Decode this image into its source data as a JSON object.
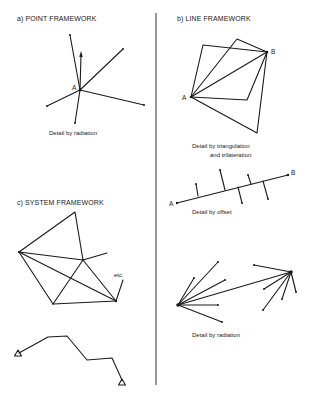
{
  "panels": {
    "a": {
      "title": "a) POINT FRAMEWORK",
      "point_label": "A",
      "caption": "Detail by radiation"
    },
    "b": {
      "title": "b) LINE FRAMEWORK",
      "label_a": "A",
      "label_b": "B",
      "caption_triangulation_1": "Detail by triangulation",
      "caption_triangulation_2": "and trilateration",
      "offset_label_a": "A",
      "offset_label_b": "B",
      "caption_offset": "Detail by offset",
      "caption_radiation": "Detail by radiation"
    },
    "c": {
      "title": "c) SYSTEM FRAMEWORK",
      "etc_label": "etc."
    }
  },
  "colors": {
    "ink": "#1a1a1a",
    "background": "#ffffff"
  }
}
